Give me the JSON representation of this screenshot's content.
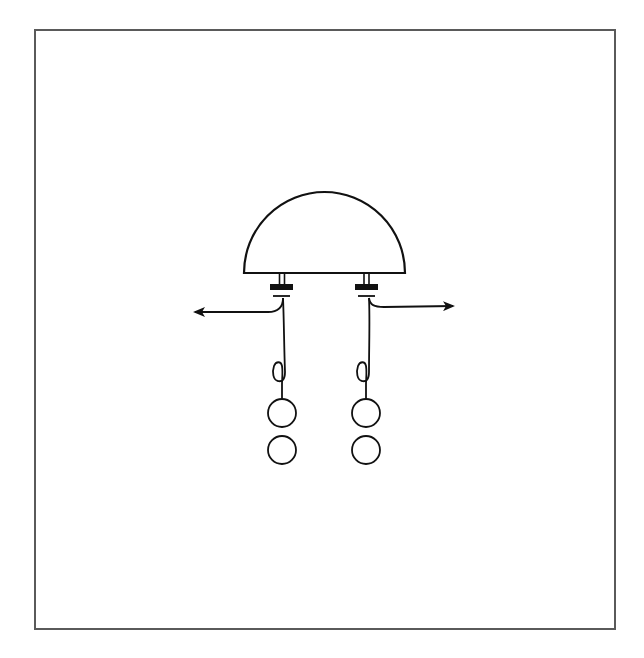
{
  "diagram": {
    "type": "schematic illustration",
    "frame": {
      "stroke": "#5a5a5a"
    },
    "stroke_color": "#111111",
    "fill_color": "#ffffff",
    "elements": {
      "dome": {
        "shape": "half-ellipse",
        "count": 1
      },
      "connectors": {
        "count": 2,
        "parts": [
          "double stem",
          "black bar",
          "T cap"
        ]
      },
      "wires": {
        "count": 2,
        "arrow_directions": [
          "left",
          "right"
        ]
      },
      "loops": {
        "count": 2
      },
      "circles": {
        "count": 4,
        "arrangement": "two columns of two"
      }
    },
    "text": []
  }
}
